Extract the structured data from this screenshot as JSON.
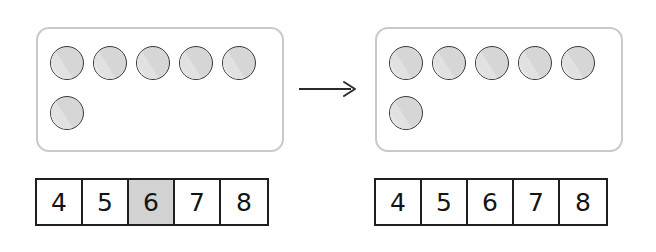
{
  "scene": {
    "title": "Counters and number track: counting on",
    "transition_icon": "right-arrow-icon",
    "counter_icon": "counter-circle-icon",
    "colors": {
      "counter_fill": "#d6d6d6",
      "counter_stroke": "#3a3a3a",
      "panel_border": "#c9c9c9",
      "cell_border": "#1f1f1f",
      "cell_highlight": "#d2d2d2",
      "page_background": "#ffffff"
    }
  },
  "groups": [
    {
      "id": "before",
      "label": "before",
      "panel": {
        "counter_total": 6,
        "rows": [
          {
            "count": 5,
            "counters": [
              "counter",
              "counter",
              "counter",
              "counter",
              "counter"
            ]
          },
          {
            "count": 1,
            "counters": [
              "counter"
            ]
          }
        ]
      },
      "number_strip": {
        "cells": [
          {
            "value": "4",
            "highlighted": false
          },
          {
            "value": "5",
            "highlighted": false
          },
          {
            "value": "6",
            "highlighted": true
          },
          {
            "value": "7",
            "highlighted": false
          },
          {
            "value": "8",
            "highlighted": false
          }
        ],
        "highlighted_value": "6"
      }
    },
    {
      "id": "after",
      "label": "after",
      "panel": {
        "counter_total": 6,
        "rows": [
          {
            "count": 5,
            "counters": [
              "counter",
              "counter",
              "counter",
              "counter",
              "counter"
            ]
          },
          {
            "count": 1,
            "counters": [
              "counter"
            ]
          }
        ]
      },
      "number_strip": {
        "cells": [
          {
            "value": "4",
            "highlighted": false
          },
          {
            "value": "5",
            "highlighted": false
          },
          {
            "value": "6",
            "highlighted": false
          },
          {
            "value": "7",
            "highlighted": false
          },
          {
            "value": "8",
            "highlighted": false
          }
        ],
        "highlighted_value": ""
      }
    }
  ]
}
